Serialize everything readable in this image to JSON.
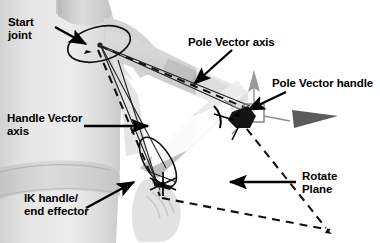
{
  "figure": {
    "background_subject": "grayscale photo of human torso and arm",
    "width": 380,
    "height": 243,
    "colors": {
      "ink": "#000000",
      "paper": "#ffffff",
      "skin_light": "#e9e9e9",
      "skin_mid": "#c9c9c9",
      "skin_dark": "#a8a8a8",
      "handle_fill": "#555555",
      "manip_gray": "#9a9a9a"
    }
  },
  "labels": {
    "start_joint": "Start\njoint",
    "handle_vector_axis": "Handle Vector\naxis",
    "ik_handle": "IK handle/\nend effector",
    "pole_vector_axis": "Pole Vector axis",
    "pole_vector_handle": "Pole Vector handle",
    "rotate_plane": "Rotate\nPlane"
  },
  "annotations": [
    {
      "name": "start-joint",
      "text": "Start joint",
      "target": "shoulder joint rotation manipulator",
      "leader": "arrow pointing right-down"
    },
    {
      "name": "handle-vector-axis",
      "text": "Handle Vector axis",
      "target": "dashed line from start joint to IK handle",
      "leader": "arrow pointing right"
    },
    {
      "name": "ik-handle",
      "text": "IK handle/end effector",
      "target": "wrist manipulator",
      "leader": "arrow pointing up-right"
    },
    {
      "name": "pole-vector-axis",
      "text": "Pole Vector axis",
      "target": "dashed line along upper arm",
      "leader": "arrow pointing down-left"
    },
    {
      "name": "pole-vector-handle",
      "text": "Pole Vector handle",
      "target": "move manipulator right of elbow",
      "leader": "arrow pointing down-left"
    },
    {
      "name": "rotate-plane",
      "text": "Rotate Plane",
      "target": "dashed triangular plane",
      "leader": "arrow pointing left"
    }
  ],
  "graphics": {
    "manipulator_kind": "translate-manipulator",
    "plane_outline": "dashed triangle",
    "joint_marker": "rotation ellipse",
    "handle_marker": "dark diamond with axis arrows"
  }
}
